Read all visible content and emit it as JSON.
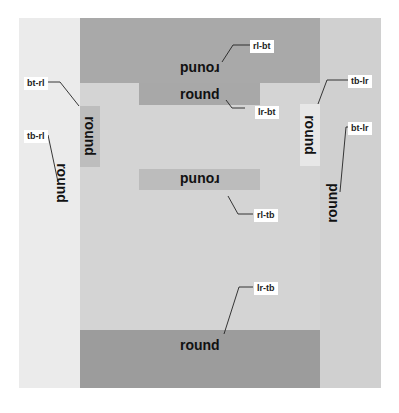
{
  "diagram": {
    "title": "",
    "word": "round",
    "colors": {
      "background": "#ffffff",
      "left_strip": "#ebebeb",
      "right_strip": "#d0d0d0",
      "top_band": "#a9a9a9",
      "center": "#d4d4d4",
      "bottom_band": "#9c9c9c",
      "lr_bt_box": "#a8a8a8",
      "rl_tb_box": "#bcbcbc",
      "left_box": "#bdbdbd",
      "right_box": "#e7e7e7"
    },
    "words": [
      {
        "id": "top-band",
        "text": "round",
        "orientation": "rotated-180"
      },
      {
        "id": "lr-bt-box",
        "text": "round",
        "orientation": "horizontal"
      },
      {
        "id": "left-box",
        "text": "round",
        "orientation": "rotated-90"
      },
      {
        "id": "right-box",
        "text": "round",
        "orientation": "rotated-90"
      },
      {
        "id": "rl-tb-box",
        "text": "round",
        "orientation": "rotated-180"
      },
      {
        "id": "left-strip",
        "text": "round",
        "orientation": "rotated-90"
      },
      {
        "id": "right-strip",
        "text": "round",
        "orientation": "rotated-270"
      },
      {
        "id": "bottom-band",
        "text": "round",
        "orientation": "horizontal"
      }
    ],
    "labels": {
      "rl_bt": "rl-bt",
      "lr_bt": "lr-bt",
      "bt_rl": "bt-rl",
      "tb_rl": "tb-rl",
      "tb_lr": "tb-lr",
      "bt_lr": "bt-lr",
      "rl_tb": "rl-tb",
      "lr_tb": "lr-tb"
    }
  }
}
